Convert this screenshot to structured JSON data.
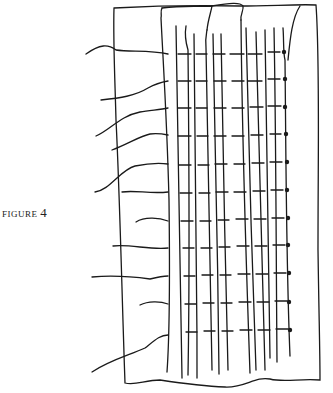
{
  "figure": {
    "caption_label": "FIGURE",
    "caption_number": "4"
  },
  "drawing": {
    "stroke_color": "#1a1a1a",
    "background": "#ffffff",
    "dots_y": [
      52,
      79,
      107,
      134,
      162,
      190,
      218,
      245,
      273,
      302,
      330
    ],
    "rung_rows_y": [
      54,
      81,
      108,
      136,
      163,
      191,
      219,
      246,
      274,
      303,
      331
    ]
  }
}
